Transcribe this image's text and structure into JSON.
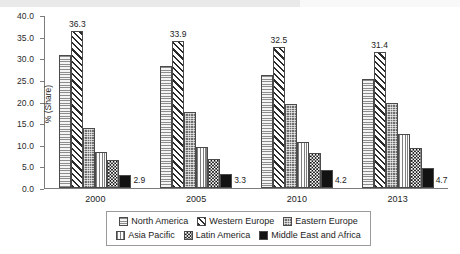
{
  "chart_data": {
    "type": "bar",
    "title": "",
    "subtitle": "",
    "xlabel": "",
    "ylabel": "% (Share)",
    "ylim": [
      0.0,
      40.0
    ],
    "ytick_step": 5.0,
    "grid": false,
    "legend_position": "bottom",
    "categories": [
      "2000",
      "2005",
      "2010",
      "2013"
    ],
    "ytick_labels": [
      "0.0",
      "5.0",
      "10.0",
      "15.0",
      "20.0",
      "25.0",
      "30.0",
      "35.0",
      "40.0"
    ],
    "series": [
      {
        "name": "North America",
        "pattern": "horizontal-lines",
        "values": [
          30.8,
          28.3,
          26.2,
          25.2
        ],
        "labels": [
          "",
          "",
          "",
          ""
        ]
      },
      {
        "name": "Western Europe",
        "pattern": "diagonal-stripes",
        "values": [
          36.3,
          33.9,
          32.5,
          31.4
        ],
        "labels": [
          "36.3",
          "33.9",
          "32.5",
          "31.4"
        ]
      },
      {
        "name": "Eastern Europe",
        "pattern": "dotted-grid",
        "values": [
          13.9,
          17.5,
          19.5,
          19.6
        ],
        "labels": [
          "",
          "",
          "",
          ""
        ]
      },
      {
        "name": "Asia Pacific",
        "pattern": "vertical-lines",
        "values": [
          8.4,
          9.5,
          10.7,
          12.5
        ],
        "labels": [
          "",
          "",
          "",
          ""
        ]
      },
      {
        "name": "Latin America",
        "pattern": "checkerboard",
        "values": [
          6.4,
          6.8,
          8.0,
          9.3
        ],
        "labels": [
          "",
          "",
          "",
          ""
        ]
      },
      {
        "name": "Middle East and Africa",
        "pattern": "solid-black",
        "values": [
          2.9,
          3.3,
          4.2,
          4.7
        ],
        "labels": [
          "2.9",
          "3.3",
          "4.2",
          "4.7"
        ]
      }
    ]
  },
  "legend": {
    "row1": [
      {
        "label": "North America",
        "key": "north-america"
      },
      {
        "label": "Western Europe",
        "key": "western-europe"
      },
      {
        "label": "Eastern Europe",
        "key": "eastern-europe"
      }
    ],
    "row2": [
      {
        "label": "Asia Pacific",
        "key": "asia-pacific"
      },
      {
        "label": "Latin America",
        "key": "latin-america"
      },
      {
        "label": "Middle East and Africa",
        "key": "middle-east-and-africa"
      }
    ]
  },
  "colors": {
    "axis": "#7c7c7c",
    "text": "#1c1c1c",
    "bar_outline": "#4a4a4a",
    "series_dark": "#121212",
    "series_light": "#f2f2f2"
  }
}
